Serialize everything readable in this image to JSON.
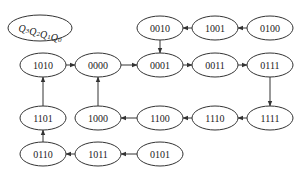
{
  "diagram": {
    "type": "state-transition",
    "legend": {
      "label": "Q3Q2Q1Q0",
      "cx": 40,
      "cy": 28,
      "rx": 32,
      "ry": 13
    },
    "nodes": [
      {
        "id": "0010",
        "label": "0010",
        "cx": 160,
        "cy": 28
      },
      {
        "id": "1001",
        "label": "1001",
        "cx": 215,
        "cy": 28
      },
      {
        "id": "0100",
        "label": "0100",
        "cx": 270,
        "cy": 28
      },
      {
        "id": "1010",
        "label": "1010",
        "cx": 43,
        "cy": 65
      },
      {
        "id": "0000",
        "label": "0000",
        "cx": 98,
        "cy": 65
      },
      {
        "id": "0001",
        "label": "0001",
        "cx": 160,
        "cy": 65
      },
      {
        "id": "0011",
        "label": "0011",
        "cx": 215,
        "cy": 65
      },
      {
        "id": "0111",
        "label": "0111",
        "cx": 270,
        "cy": 65
      },
      {
        "id": "1101",
        "label": "1101",
        "cx": 43,
        "cy": 118
      },
      {
        "id": "1000",
        "label": "1000",
        "cx": 98,
        "cy": 118
      },
      {
        "id": "1100",
        "label": "1100",
        "cx": 160,
        "cy": 118
      },
      {
        "id": "1110",
        "label": "1110",
        "cx": 215,
        "cy": 118
      },
      {
        "id": "1111",
        "label": "1111",
        "cx": 270,
        "cy": 118
      },
      {
        "id": "0110",
        "label": "0110",
        "cx": 43,
        "cy": 154
      },
      {
        "id": "1011",
        "label": "1011",
        "cx": 98,
        "cy": 154
      },
      {
        "id": "0101",
        "label": "0101",
        "cx": 160,
        "cy": 154
      }
    ],
    "edges": [
      {
        "from": "0100",
        "to": "1001"
      },
      {
        "from": "1001",
        "to": "0010"
      },
      {
        "from": "0010",
        "to": "0001"
      },
      {
        "from": "1010",
        "to": "0000"
      },
      {
        "from": "0000",
        "to": "0001"
      },
      {
        "from": "0001",
        "to": "0011"
      },
      {
        "from": "0011",
        "to": "0111"
      },
      {
        "from": "0111",
        "to": "1111"
      },
      {
        "from": "1111",
        "to": "1110"
      },
      {
        "from": "1110",
        "to": "1100"
      },
      {
        "from": "1100",
        "to": "1000"
      },
      {
        "from": "1000",
        "to": "0000"
      },
      {
        "from": "0101",
        "to": "1011"
      },
      {
        "from": "1011",
        "to": "0110"
      },
      {
        "from": "0110",
        "to": "1101"
      },
      {
        "from": "1101",
        "to": "1010"
      }
    ],
    "node_rx": 23,
    "node_ry": 12,
    "stroke_color": "#333333"
  }
}
